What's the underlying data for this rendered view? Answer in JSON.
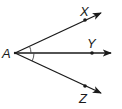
{
  "diagram": {
    "title": "",
    "vertex": {
      "label": "A",
      "x": 15,
      "y": 53,
      "label_x": 2,
      "label_y": 58
    },
    "rays": [
      {
        "name": "ray-AX",
        "point_label": "X",
        "point": [
          85,
          20
        ],
        "tip": [
          101,
          13
        ],
        "label_pos": [
          80,
          16
        ]
      },
      {
        "name": "ray-AY",
        "point_label": "Y",
        "point": [
          92,
          53
        ],
        "tip": [
          111,
          53
        ],
        "label_pos": [
          87,
          48
        ]
      },
      {
        "name": "ray-AZ",
        "point_label": "Z",
        "point": [
          85,
          86
        ],
        "tip": [
          101,
          93
        ],
        "label_pos": [
          79,
          102
        ]
      }
    ],
    "angle_marks": [
      {
        "between": [
          "X",
          "Y"
        ],
        "radius": 16
      },
      {
        "between": [
          "Y",
          "Z"
        ],
        "radius": 19
      }
    ],
    "colors": {
      "stroke": "#1a1a1a",
      "background": "#ffffff"
    }
  },
  "labels": {
    "A": "A",
    "X": "X",
    "Y": "Y",
    "Z": "Z"
  }
}
